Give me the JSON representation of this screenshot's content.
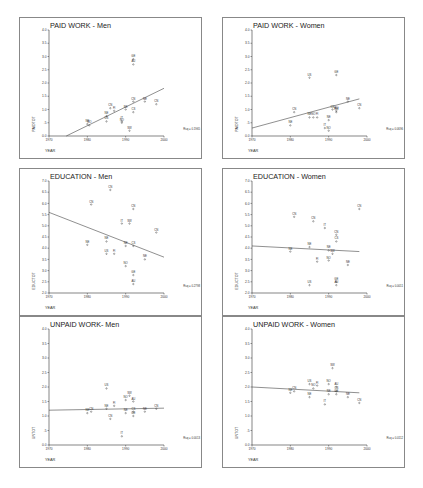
{
  "layout": {
    "panels": [
      {
        "x": 19,
        "y": 17,
        "w": 183,
        "h": 142
      },
      {
        "x": 222,
        "y": 17,
        "w": 183,
        "h": 142
      },
      {
        "x": 19,
        "y": 168,
        "w": 183,
        "h": 148
      },
      {
        "x": 222,
        "y": 168,
        "w": 183,
        "h": 148
      },
      {
        "x": 19,
        "y": 316,
        "w": 183,
        "h": 152
      },
      {
        "x": 222,
        "y": 316,
        "w": 183,
        "h": 152
      }
    ]
  },
  "chart_data": [
    {
      "type": "scatter",
      "title": "PAID WORK - Men",
      "xlabel": "YEAR",
      "ylabel": "PAIDTOT",
      "xlim": [
        1970,
        2000
      ],
      "ylim": [
        0.0,
        4.0
      ],
      "xticks": [
        "1970",
        "1980",
        "1990",
        "2000"
      ],
      "yticks": [
        "0.0",
        ".5",
        "1.0",
        "1.5",
        "2.0",
        "2.5",
        "3.0",
        "3.5",
        "4.0"
      ],
      "r2_label": "Rsq = 0.1965",
      "fit": {
        "x": [
          1974.5,
          2000
        ],
        "y": [
          0.0,
          1.8
        ]
      },
      "points": [
        {
          "label": "NE",
          "x": 1980,
          "y": 0.45
        },
        {
          "label": "NO",
          "x": 1980.5,
          "y": 0.4
        },
        {
          "label": "US",
          "x": 1985,
          "y": 0.55
        },
        {
          "label": "CN",
          "x": 1986,
          "y": 1.05
        },
        {
          "label": "FI",
          "x": 1987,
          "y": 0.95
        },
        {
          "label": "NE",
          "x": 1985,
          "y": 0.75
        },
        {
          "label": "NE",
          "x": 1990,
          "y": 1.0
        },
        {
          "label": "CN",
          "x": 1992,
          "y": 1.3
        },
        {
          "label": "CS",
          "x": 1992,
          "y": 0.9
        },
        {
          "label": "NE",
          "x": 1995,
          "y": 1.3
        },
        {
          "label": "CN",
          "x": 1998,
          "y": 1.2
        },
        {
          "label": "NO",
          "x": 1989,
          "y": 0.5
        },
        {
          "label": "IT",
          "x": 1989,
          "y": 0.55
        },
        {
          "label": "SW",
          "x": 1991,
          "y": 0.2
        },
        {
          "label": "GE",
          "x": 1992,
          "y": 2.9
        },
        {
          "label": "AU",
          "x": 1992,
          "y": 2.7
        }
      ]
    },
    {
      "type": "scatter",
      "title": "PAID WORK - Women",
      "xlabel": "YEAR",
      "ylabel": "PAIDTOT",
      "xlim": [
        1970,
        2000
      ],
      "ylim": [
        0.0,
        4.0
      ],
      "xticks": [
        "1970",
        "1980",
        "1990",
        "2000"
      ],
      "yticks": [
        "0.0",
        ".5",
        "1.0",
        "1.5",
        "2.0",
        "2.5",
        "3.0",
        "3.5",
        "4.0"
      ],
      "r2_label": "Rsq = 0.0696",
      "fit": {
        "x": [
          1970,
          1998
        ],
        "y": [
          0.3,
          1.4
        ]
      },
      "points": [
        {
          "label": "NE",
          "x": 1980,
          "y": 0.4
        },
        {
          "label": "CN",
          "x": 1981,
          "y": 0.9
        },
        {
          "label": "US",
          "x": 1985,
          "y": 2.2
        },
        {
          "label": "NE",
          "x": 1985,
          "y": 0.7
        },
        {
          "label": "NO",
          "x": 1986,
          "y": 0.7
        },
        {
          "label": "FI",
          "x": 1987,
          "y": 0.7
        },
        {
          "label": "NE",
          "x": 1990,
          "y": 0.6
        },
        {
          "label": "IT",
          "x": 1989,
          "y": 0.3
        },
        {
          "label": "NO",
          "x": 1990,
          "y": 0.2
        },
        {
          "label": "CN",
          "x": 1991,
          "y": 1.0
        },
        {
          "label": "AU",
          "x": 1992,
          "y": 0.95
        },
        {
          "label": "SW",
          "x": 1992,
          "y": 0.9
        },
        {
          "label": "NE",
          "x": 1995,
          "y": 1.3
        },
        {
          "label": "CN",
          "x": 1998,
          "y": 1.05
        },
        {
          "label": "GE",
          "x": 1992,
          "y": 2.3
        }
      ]
    },
    {
      "type": "scatter",
      "title": "EDUCATION - Men",
      "xlabel": "YEAR",
      "ylabel": "EDUCTOT",
      "xlim": [
        1970,
        2000
      ],
      "ylim": [
        2.0,
        7.0
      ],
      "xticks": [
        "1970",
        "1980",
        "1990",
        "2000"
      ],
      "yticks": [
        "2.0",
        "2.5",
        "3.0",
        "3.5",
        "4.0",
        "4.5",
        "5.0",
        "5.5",
        "6.0",
        "6.5",
        "7.0"
      ],
      "r2_label": "Rsq = 0.2798",
      "fit": {
        "x": [
          1970,
          2000
        ],
        "y": [
          5.6,
          3.6
        ]
      },
      "points": [
        {
          "label": "CN",
          "x": 1986,
          "y": 6.6
        },
        {
          "label": "CN",
          "x": 1981,
          "y": 5.95
        },
        {
          "label": "CN",
          "x": 1992,
          "y": 5.75
        },
        {
          "label": "IT",
          "x": 1989,
          "y": 5.1
        },
        {
          "label": "SW",
          "x": 1991,
          "y": 5.1
        },
        {
          "label": "CN",
          "x": 1998,
          "y": 4.7
        },
        {
          "label": "NE",
          "x": 1980,
          "y": 4.15
        },
        {
          "label": "NE",
          "x": 1985,
          "y": 4.3
        },
        {
          "label": "NE",
          "x": 1990,
          "y": 4.1
        },
        {
          "label": "CS",
          "x": 1992,
          "y": 4.1
        },
        {
          "label": "US",
          "x": 1985,
          "y": 3.75
        },
        {
          "label": "FI",
          "x": 1987,
          "y": 3.75
        },
        {
          "label": "NE",
          "x": 1995,
          "y": 3.5
        },
        {
          "label": "NO",
          "x": 1990,
          "y": 3.2
        },
        {
          "label": "GE",
          "x": 1992,
          "y": 2.8
        },
        {
          "label": "AU",
          "x": 1992,
          "y": 2.4
        }
      ]
    },
    {
      "type": "scatter",
      "title": "EDUCATION - Women",
      "xlabel": "YEAR",
      "ylabel": "EDUCTOT",
      "xlim": [
        1970,
        2000
      ],
      "ylim": [
        2.0,
        7.0
      ],
      "xticks": [
        "1970",
        "1980",
        "1990",
        "2000"
      ],
      "yticks": [
        "2.0",
        "2.5",
        "3.0",
        "3.5",
        "4.0",
        "4.5",
        "5.0",
        "5.5",
        "6.0",
        "6.5",
        "7.0"
      ],
      "r2_label": "Rsq = 0.0011",
      "fit": {
        "x": [
          1970,
          1998
        ],
        "y": [
          4.1,
          3.85
        ]
      },
      "points": [
        {
          "label": "CN",
          "x": 1998,
          "y": 5.75
        },
        {
          "label": "CN",
          "x": 1981,
          "y": 5.4
        },
        {
          "label": "CN",
          "x": 1986,
          "y": 5.2
        },
        {
          "label": "IT",
          "x": 1989,
          "y": 4.9
        },
        {
          "label": "CN",
          "x": 1992,
          "y": 4.6
        },
        {
          "label": "CS",
          "x": 1992,
          "y": 4.3
        },
        {
          "label": "NE",
          "x": 1980,
          "y": 3.85
        },
        {
          "label": "NE",
          "x": 1985,
          "y": 4.05
        },
        {
          "label": "NE",
          "x": 1990,
          "y": 3.9
        },
        {
          "label": "SW",
          "x": 1991,
          "y": 3.75
        },
        {
          "label": "FI",
          "x": 1987,
          "y": 3.4
        },
        {
          "label": "NO",
          "x": 1990,
          "y": 3.45
        },
        {
          "label": "NE",
          "x": 1995,
          "y": 3.25
        },
        {
          "label": "US",
          "x": 1985,
          "y": 2.35
        },
        {
          "label": "GE",
          "x": 1992,
          "y": 2.5
        },
        {
          "label": "AU",
          "x": 1992,
          "y": 2.35
        }
      ]
    },
    {
      "type": "scatter",
      "title": "UNPAID WORK- Men",
      "xlabel": "YEAR",
      "ylabel": "UNTOT",
      "xlim": [
        1970,
        2000
      ],
      "ylim": [
        0.0,
        4.0
      ],
      "xticks": [
        "1970",
        "1980",
        "1990",
        "2000"
      ],
      "yticks": [
        "0.0",
        ".5",
        "1.0",
        "1.5",
        "2.0",
        "2.5",
        "3.0",
        "3.5",
        "4.0"
      ],
      "r2_label": "Rsq = 0.0013",
      "fit": {
        "x": [
          1970,
          2000
        ],
        "y": [
          1.2,
          1.27
        ]
      },
      "points": [
        {
          "label": "US",
          "x": 1985,
          "y": 1.95
        },
        {
          "label": "SW",
          "x": 1991,
          "y": 1.7
        },
        {
          "label": "NO",
          "x": 1990,
          "y": 1.55
        },
        {
          "label": "AU",
          "x": 1992,
          "y": 1.5
        },
        {
          "label": "FI",
          "x": 1987,
          "y": 1.35
        },
        {
          "label": "NE",
          "x": 1985,
          "y": 1.25
        },
        {
          "label": "NE",
          "x": 1980,
          "y": 1.1
        },
        {
          "label": "CN",
          "x": 1981,
          "y": 1.15
        },
        {
          "label": "NE",
          "x": 1990,
          "y": 1.1
        },
        {
          "label": "CS",
          "x": 1992,
          "y": 1.15
        },
        {
          "label": "GE",
          "x": 1992,
          "y": 1.0
        },
        {
          "label": "NE",
          "x": 1995,
          "y": 1.15
        },
        {
          "label": "CN",
          "x": 1998,
          "y": 1.25
        },
        {
          "label": "CN",
          "x": 1986,
          "y": 0.9
        },
        {
          "label": "IT",
          "x": 1989,
          "y": 0.3
        }
      ]
    },
    {
      "type": "scatter",
      "title": "UNPAID WORK - Women",
      "xlabel": "YEAR",
      "ylabel": "UNTOT",
      "xlim": [
        1970,
        2000
      ],
      "ylim": [
        0.0,
        4.0
      ],
      "xticks": [
        "1970",
        "1980",
        "1990",
        "2000"
      ],
      "yticks": [
        "0.0",
        ".5",
        "1.0",
        "1.5",
        "2.0",
        "2.5",
        "3.0",
        "3.5",
        "4.0"
      ],
      "r2_label": "Rsq = 0.0112",
      "fit": {
        "x": [
          1970,
          1998
        ],
        "y": [
          2.0,
          1.8
        ]
      },
      "points": [
        {
          "label": "SW",
          "x": 1991,
          "y": 2.65
        },
        {
          "label": "US",
          "x": 1985,
          "y": 2.1
        },
        {
          "label": "FI",
          "x": 1987,
          "y": 2.05
        },
        {
          "label": "NO",
          "x": 1986,
          "y": 1.95
        },
        {
          "label": "NO",
          "x": 1990,
          "y": 2.1
        },
        {
          "label": "AU",
          "x": 1992,
          "y": 2.0
        },
        {
          "label": "NE",
          "x": 1980,
          "y": 1.8
        },
        {
          "label": "CN",
          "x": 1981,
          "y": 1.85
        },
        {
          "label": "NE",
          "x": 1985,
          "y": 1.65
        },
        {
          "label": "NE",
          "x": 1990,
          "y": 1.75
        },
        {
          "label": "CS",
          "x": 1992,
          "y": 1.85
        },
        {
          "label": "GE",
          "x": 1992,
          "y": 1.75
        },
        {
          "label": "NE",
          "x": 1995,
          "y": 1.65
        },
        {
          "label": "IT",
          "x": 1989,
          "y": 1.4
        },
        {
          "label": "CN",
          "x": 1998,
          "y": 1.45
        }
      ]
    }
  ]
}
